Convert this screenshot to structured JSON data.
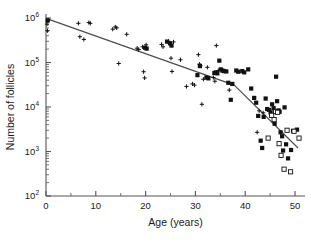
{
  "chart_data": {
    "type": "scatter",
    "title": "",
    "xlabel": "Age (years)",
    "ylabel": "Number of follicles",
    "xlim": [
      0,
      52
    ],
    "ylim_log10": [
      2,
      6
    ],
    "x_ticks": [
      0,
      10,
      20,
      30,
      40,
      50
    ],
    "x_minor_ticks": [
      5,
      15,
      25,
      35,
      45
    ],
    "y_ticks_log10": [
      2,
      3,
      4,
      5,
      6
    ],
    "y_tick_labels": [
      "10",
      "10",
      "10",
      "10",
      "10"
    ],
    "y_tick_exponents": [
      "2",
      "3",
      "4",
      "5",
      "6"
    ],
    "grid": false,
    "legend": "none",
    "yscale": "log",
    "series": [
      {
        "name": "plus-marker",
        "marker": "plus",
        "color": "#111111",
        "points": [
          [
            0.2,
            730000
          ],
          [
            0.3,
            520000
          ],
          [
            0.4,
            880000
          ],
          [
            6.5,
            760000
          ],
          [
            6.8,
            380000
          ],
          [
            7.6,
            330000
          ],
          [
            8.6,
            790000
          ],
          [
            8.9,
            760000
          ],
          [
            13.4,
            560000
          ],
          [
            13.9,
            630000
          ],
          [
            14.2,
            600000
          ],
          [
            14.6,
            95000
          ],
          [
            16.2,
            430000
          ],
          [
            18.3,
            210000
          ],
          [
            18.6,
            195000
          ],
          [
            19.4,
            225000
          ],
          [
            19.6,
            62000
          ],
          [
            19.8,
            45000
          ],
          [
            20.1,
            250000
          ],
          [
            23.2,
            255000
          ],
          [
            23.5,
            225000
          ],
          [
            24.6,
            300000
          ],
          [
            24.8,
            270000
          ],
          [
            25.1,
            125000
          ],
          [
            25.3,
            63000
          ],
          [
            25.6,
            290000
          ],
          [
            27.0,
            115000
          ],
          [
            28.2,
            29000
          ],
          [
            29.4,
            33000
          ],
          [
            29.8,
            31000
          ],
          [
            30.6,
            150000
          ],
          [
            30.8,
            92000
          ],
          [
            31.0,
            85000
          ],
          [
            31.3,
            11500
          ],
          [
            31.6,
            42000
          ],
          [
            32.4,
            78000
          ],
          [
            33.6,
            46000
          ],
          [
            33.9,
            38000
          ],
          [
            34.2,
            240000
          ],
          [
            34.6,
            66000
          ],
          [
            36.8,
            24000
          ],
          [
            42.4,
            2700
          ],
          [
            42.8,
            8200
          ],
          [
            43.6,
            7400
          ]
        ]
      },
      {
        "name": "filled-square-marker",
        "marker": "filled-square",
        "color": "#111111",
        "points": [
          [
            0.35,
            880000
          ],
          [
            19.9,
            215000
          ],
          [
            20.2,
            205000
          ],
          [
            24.3,
            295000
          ],
          [
            24.9,
            270000
          ],
          [
            25.2,
            240000
          ],
          [
            30.4,
            52000
          ],
          [
            30.9,
            83000
          ],
          [
            32.2,
            46000
          ],
          [
            32.6,
            44000
          ],
          [
            33.8,
            58000
          ],
          [
            34.1,
            60000
          ],
          [
            34.4,
            57000
          ],
          [
            34.8,
            110000
          ],
          [
            35.1,
            70000
          ],
          [
            35.4,
            66000
          ],
          [
            35.7,
            64000
          ],
          [
            36.2,
            63000
          ],
          [
            36.6,
            35000
          ],
          [
            37.1,
            14500
          ],
          [
            37.4,
            33000
          ],
          [
            38.2,
            66000
          ],
          [
            38.6,
            62000
          ],
          [
            39.4,
            64000
          ],
          [
            39.8,
            60000
          ],
          [
            40.6,
            70000
          ],
          [
            41.2,
            26000
          ],
          [
            41.8,
            16000
          ],
          [
            42.2,
            12500
          ],
          [
            42.6,
            6300
          ],
          [
            43.1,
            1750
          ],
          [
            43.4,
            1200
          ],
          [
            43.7,
            6000
          ],
          [
            44.1,
            15500
          ],
          [
            44.4,
            9000
          ],
          [
            44.8,
            8600
          ],
          [
            45.1,
            7600
          ],
          [
            45.4,
            11500
          ],
          [
            45.7,
            9400
          ],
          [
            45.9,
            4200
          ],
          [
            46.2,
            48000
          ],
          [
            46.4,
            13500
          ],
          [
            46.7,
            8400
          ],
          [
            46.9,
            7800
          ],
          [
            47.1,
            2700
          ],
          [
            47.4,
            2200
          ],
          [
            47.6,
            1050
          ],
          [
            47.9,
            9800
          ],
          [
            48.2,
            1450
          ],
          [
            48.6,
            700
          ],
          [
            49.2,
            1080
          ],
          [
            49.6,
            2900
          ],
          [
            50.4,
            3100
          ]
        ]
      },
      {
        "name": "open-square-marker",
        "marker": "open-square",
        "color": "#111111",
        "points": [
          [
            44.6,
            2000
          ],
          [
            45.3,
            6500
          ],
          [
            45.8,
            5200
          ],
          [
            46.1,
            7900
          ],
          [
            46.5,
            7600
          ],
          [
            46.8,
            1500
          ],
          [
            47.2,
            820
          ],
          [
            47.8,
            400
          ],
          [
            48.4,
            3000
          ],
          [
            49.1,
            350
          ],
          [
            49.8,
            2850
          ],
          [
            50.8,
            2000
          ]
        ]
      }
    ],
    "fit_line": {
      "name": "piecewise-regression-line",
      "color": "#4d4d4d",
      "breakpoint_age": 37.8,
      "breakpoint_value": 31000,
      "vertices": [
        [
          0.0,
          980000
        ],
        [
          37.8,
          31000
        ],
        [
          50.6,
          1200
        ]
      ]
    }
  }
}
